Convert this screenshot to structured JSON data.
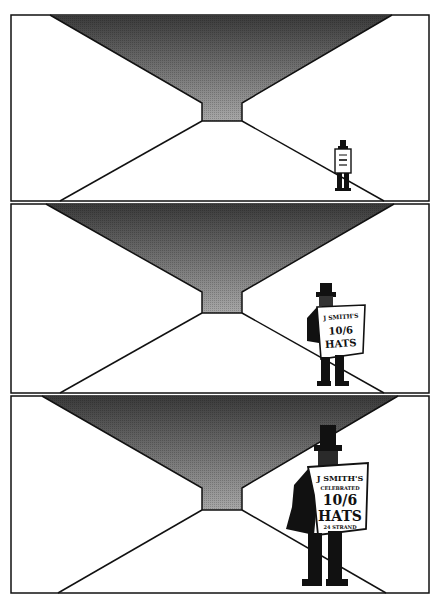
{
  "comic": {
    "panels": [
      {
        "id": 1,
        "y_top": 15,
        "y_bottom": 201,
        "figure_scale": "small",
        "sign": {
          "line1": "",
          "line2": "",
          "line3": "",
          "line4": "",
          "line5": ""
        }
      },
      {
        "id": 2,
        "y_top": 204,
        "y_bottom": 393,
        "figure_scale": "medium",
        "sign": {
          "line1": "J SMITH'S",
          "line2": "",
          "line3": "10/6",
          "line4": "HATS",
          "line5": ""
        }
      },
      {
        "id": 3,
        "y_top": 396,
        "y_bottom": 593,
        "figure_scale": "large",
        "sign": {
          "line1": "J SMITH'S",
          "line2": "CELEBRATED",
          "line3": "10/6",
          "line4": "HATS",
          "line5": "24 STRAND"
        }
      }
    ],
    "colors": {
      "ink": "#111111",
      "paper": "#ffffff",
      "tone_dark": "#3a3a3a",
      "tone_light": "#a8a8a8"
    }
  }
}
